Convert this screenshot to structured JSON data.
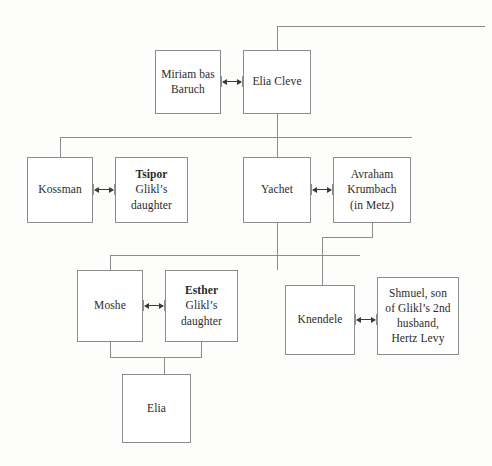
{
  "diagram": {
    "type": "family-tree",
    "line_color": "#8c8c8c",
    "box_border_color": "#8c8c8c",
    "background_color": "#fdfdfc",
    "text_color": "#2b2b2b"
  },
  "nodes": {
    "miriam": {
      "line1": "Miriam bas",
      "line2": "Baruch"
    },
    "elia_cleve": {
      "line1": "Elia Cleve"
    },
    "kossman": {
      "line1": "Kossman"
    },
    "tsipor": {
      "line1": "Tsipor",
      "line2": "Glikl’s",
      "line3": "daughter"
    },
    "yachet": {
      "line1": "Yachet"
    },
    "avraham": {
      "line1": "Avraham",
      "line2": "Krumbach",
      "line3": "(in Metz)"
    },
    "moshe": {
      "line1": "Moshe"
    },
    "esther": {
      "line1": "Esther",
      "line2": "Glikl’s",
      "line3": "daughter"
    },
    "knendele": {
      "line1": "Knendele"
    },
    "shmuel": {
      "line1": "Shmuel, son",
      "line2": "of Glikl’s 2nd",
      "line3": "husband,",
      "line4": "Hertz Levy"
    },
    "elia_child": {
      "line1": "Elia"
    }
  },
  "marriages": [
    {
      "id": "miriam-elia",
      "left": "Miriam bas Baruch",
      "right": "Elia Cleve"
    },
    {
      "id": "kossman-tsipor",
      "left": "Kossman",
      "right": "Tsipor"
    },
    {
      "id": "yachet-avraham",
      "left": "Yachet",
      "right": "Avraham Krumbach"
    },
    {
      "id": "moshe-esther",
      "left": "Moshe",
      "right": "Esther"
    },
    {
      "id": "knendele-shmuel",
      "left": "Knendele",
      "right": "Shmuel"
    }
  ]
}
